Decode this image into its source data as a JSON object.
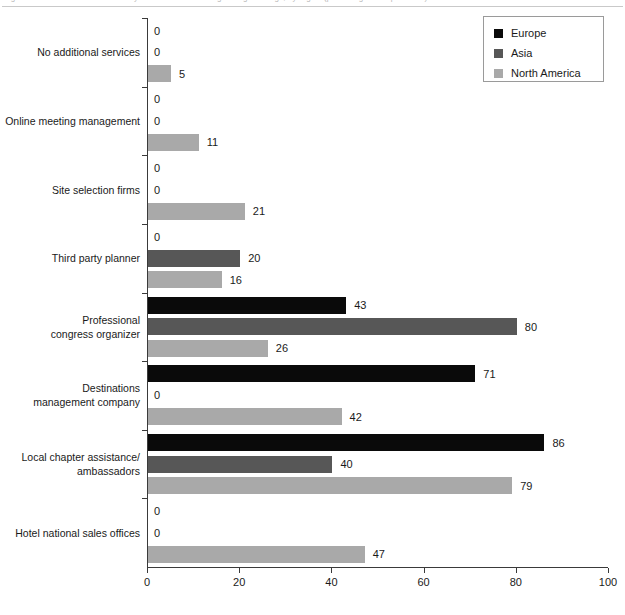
{
  "caption": {
    "text": "Figure 6.  Additional services used by associations when organizing meetings, by region (percentage of respondents)"
  },
  "legend": {
    "position": "top-right",
    "items": [
      {
        "label": "Europe",
        "color": "#0a0a0a",
        "key": "europe"
      },
      {
        "label": "Asia",
        "color": "#575757",
        "key": "asia"
      },
      {
        "label": "North America",
        "color": "#a9a9a9",
        "key": "northamerica"
      }
    ]
  },
  "axes": {
    "x_ticks": [
      "0",
      "20",
      "40",
      "60",
      "80",
      "100"
    ],
    "xlabel": "",
    "ylabel": ""
  },
  "chart_data": {
    "type": "bar",
    "orientation": "horizontal",
    "title": "",
    "subtitle": "",
    "xlabel": "",
    "ylabel": "",
    "xlim": [
      0,
      100
    ],
    "xticks": [
      0,
      20,
      40,
      60,
      80,
      100
    ],
    "grid": false,
    "legend_position": "top-right",
    "categories": [
      "No additional services",
      "Online meeting management",
      "Site selection firms",
      "Third party planner",
      "Professional\ncongress organizer",
      "Destinations\nmanagement company",
      "Local chapter assistance/\nambassadors",
      "Hotel national sales offices"
    ],
    "series": [
      {
        "name": "Europe",
        "color": "#0a0a0a",
        "values": [
          0,
          0,
          0,
          0,
          43,
          71,
          86,
          0
        ]
      },
      {
        "name": "Asia",
        "color": "#575757",
        "values": [
          0,
          0,
          0,
          20,
          80,
          0,
          40,
          0
        ]
      },
      {
        "name": "North America",
        "color": "#a9a9a9",
        "values": [
          5,
          11,
          21,
          16,
          26,
          42,
          79,
          47
        ]
      }
    ]
  }
}
